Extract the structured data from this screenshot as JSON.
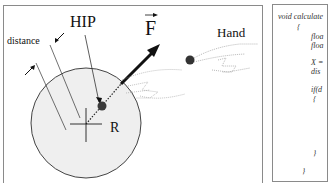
{
  "diagram": {
    "labels": {
      "hip": "HIP",
      "force": "F",
      "hand": "Hand",
      "distance": "distance",
      "radius": "R"
    },
    "code_panel": {
      "lines": [
        "void calculate",
        "{",
        "floa",
        "floa",
        "X =",
        "dis",
        "if(d",
        "{",
        "}",
        "}"
      ]
    },
    "colors": {
      "sphere_fill": "#efefef",
      "stroke": "#222222",
      "hip_point": "#3a3a3a",
      "frame": "#8a8a8a"
    }
  }
}
